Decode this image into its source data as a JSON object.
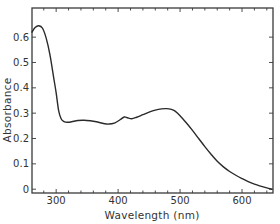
{
  "chart_data": {
    "type": "line",
    "title": "",
    "xlabel": "Wavelength (nm)",
    "ylabel": "Absorbance",
    "xlim": [
      261,
      650
    ],
    "ylim": [
      -0.015,
      0.715
    ],
    "grid": false,
    "legend": null,
    "x_ticks": [
      300,
      400,
      500,
      600
    ],
    "x_tick_labels": [
      "300",
      "400",
      "500",
      "600"
    ],
    "x_minor_step": 20,
    "y_ticks": [
      0,
      0.1,
      0.2,
      0.3,
      0.4,
      0.5,
      0.6
    ],
    "y_tick_labels": [
      "0",
      "0.1",
      "0.2",
      "0.3",
      "0.4",
      "0.5",
      "0.6"
    ],
    "series": [
      {
        "name": "Absorbance spectrum",
        "color": "#2a2a2a",
        "x": [
          261,
          266,
          272,
          278,
          284,
          290,
          296,
          300,
          304,
          308,
          312,
          318,
          325,
          335,
          345,
          355,
          365,
          375,
          385,
          395,
          403,
          410,
          415,
          422,
          430,
          440,
          450,
          460,
          470,
          478,
          486,
          492,
          500,
          510,
          520,
          530,
          540,
          550,
          560,
          570,
          580,
          590,
          600,
          610,
          620,
          630,
          640,
          648
        ],
        "y": [
          0.62,
          0.638,
          0.645,
          0.635,
          0.595,
          0.53,
          0.44,
          0.38,
          0.31,
          0.278,
          0.268,
          0.264,
          0.266,
          0.271,
          0.272,
          0.27,
          0.266,
          0.26,
          0.257,
          0.262,
          0.274,
          0.285,
          0.282,
          0.278,
          0.284,
          0.294,
          0.304,
          0.312,
          0.317,
          0.318,
          0.315,
          0.308,
          0.29,
          0.262,
          0.232,
          0.2,
          0.168,
          0.138,
          0.11,
          0.088,
          0.07,
          0.055,
          0.042,
          0.03,
          0.02,
          0.012,
          0.005,
          0.0
        ]
      }
    ]
  },
  "axes": {
    "xlabel": "Wavelength (nm)",
    "ylabel": "Absorbance"
  }
}
